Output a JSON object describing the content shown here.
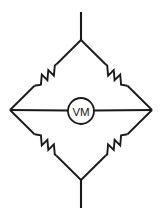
{
  "diagram": {
    "background_color": "#ffffff",
    "line_color": "#1a1a1a",
    "nodes": {
      "top": {
        "label": "top-node",
        "x": 81,
        "y": 40
      },
      "bottom": {
        "label": "bottom-node",
        "x": 81,
        "y": 180
      },
      "left": {
        "label": "left-node",
        "x": 10,
        "y": 110
      },
      "right": {
        "label": "right-node",
        "x": 152,
        "y": 110
      }
    },
    "leads": [
      {
        "name": "top-terminal-lead",
        "from_x": 81,
        "from_y": 40,
        "to_x": 81,
        "to_y": 12
      },
      {
        "name": "bottom-terminal-lead",
        "from_x": 81,
        "from_y": 180,
        "to_x": 81,
        "to_y": 208
      }
    ],
    "branches": [
      {
        "name": "branch-top-left",
        "from": "left",
        "to": "top",
        "component": "resistor"
      },
      {
        "name": "branch-top-right",
        "from": "top",
        "to": "right",
        "component": "resistor"
      },
      {
        "name": "branch-bottom-left",
        "from": "left",
        "to": "bottom",
        "component": "resistor"
      },
      {
        "name": "branch-bottom-right",
        "from": "bottom",
        "to": "right",
        "component": "resistor"
      },
      {
        "name": "branch-bridge",
        "from": "left",
        "to": "right",
        "component": "voltmeter"
      }
    ],
    "resistors": [
      {
        "name": "resistor-top-left",
        "label": ""
      },
      {
        "name": "resistor-top-right",
        "label": ""
      },
      {
        "name": "resistor-bottom-left",
        "label": ""
      },
      {
        "name": "resistor-bottom-right",
        "label": ""
      }
    ],
    "meter": {
      "name": "voltmeter",
      "label": "VM",
      "center_x": 81,
      "center_y": 111,
      "radius": 13
    }
  }
}
